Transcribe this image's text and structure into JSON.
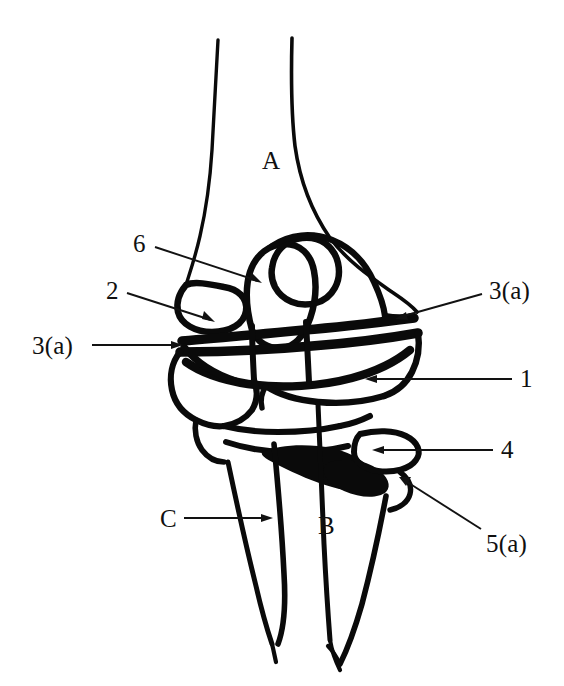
{
  "figure": {
    "kind": "anatomical-line-diagram",
    "background_color": "#ffffff",
    "ink_color": "#0a0a0a",
    "width": 564,
    "height": 686
  },
  "labels": [
    {
      "id": "label-a",
      "text": "A",
      "x": 262,
      "y": 148,
      "kind": "letter",
      "has_leader": false,
      "describes": "upper bone shaft (humerus)"
    },
    {
      "id": "label-6",
      "text": "6",
      "x": 133,
      "y": 231,
      "kind": "number",
      "has_leader": true,
      "leader": {
        "from_x": 155,
        "from_y": 247,
        "to_x": 262,
        "to_y": 283,
        "head": "arrow-down-right"
      },
      "describes": "upper inner loop structure of joint"
    },
    {
      "id": "label-2",
      "text": "2",
      "x": 106,
      "y": 278,
      "kind": "number",
      "has_leader": true,
      "leader": {
        "from_x": 127,
        "from_y": 293,
        "to_x": 215,
        "to_y": 322,
        "head": "arrow-down-right"
      },
      "describes": "left condylar prominence"
    },
    {
      "id": "label-3a-left",
      "text": "3(a)",
      "x": 32,
      "y": 333,
      "kind": "number-letter",
      "has_leader": true,
      "leader": {
        "from_x": 92,
        "from_y": 345,
        "to_x": 182,
        "to_y": 345,
        "head": "arrow-right"
      },
      "describes": "ligament band, left attachment"
    },
    {
      "id": "label-3a-right",
      "text": "3(a)",
      "x": 489,
      "y": 278,
      "kind": "number-letter",
      "has_leader": true,
      "leader": {
        "from_x": 482,
        "from_y": 294,
        "to_x": 396,
        "to_y": 319,
        "head": "arrow-down-left"
      },
      "describes": "ligament band, right attachment"
    },
    {
      "id": "label-1",
      "text": "1",
      "x": 520,
      "y": 366,
      "kind": "number",
      "has_leader": true,
      "leader": {
        "from_x": 512,
        "from_y": 379,
        "to_x": 366,
        "to_y": 379,
        "head": "arrow-left"
      },
      "describes": "main articular body of upper bone"
    },
    {
      "id": "label-4",
      "text": "4",
      "x": 501,
      "y": 437,
      "kind": "number",
      "has_leader": true,
      "leader": {
        "from_x": 493,
        "from_y": 450,
        "to_x": 372,
        "to_y": 450,
        "head": "arrow-left"
      },
      "describes": "radial head region"
    },
    {
      "id": "label-5a",
      "text": "5(a)",
      "x": 486,
      "y": 531,
      "kind": "number-letter",
      "has_leader": true,
      "leader": {
        "from_x": 481,
        "from_y": 529,
        "to_x": 400,
        "to_y": 477,
        "head": "arrow-up-left"
      },
      "describes": "annular ligament / lower joint capsule"
    },
    {
      "id": "label-c",
      "text": "C",
      "x": 160,
      "y": 506,
      "kind": "letter",
      "has_leader": true,
      "leader": {
        "from_x": 184,
        "from_y": 518,
        "to_x": 272,
        "to_y": 518,
        "head": "arrow-right"
      },
      "describes": "left lower bone shaft (ulna)"
    },
    {
      "id": "label-b",
      "text": "B",
      "x": 318,
      "y": 513,
      "kind": "letter",
      "has_leader": false,
      "describes": "right lower bone shaft (radius)"
    }
  ],
  "drawing": {
    "stroke_color": "#0a0a0a",
    "thin_stroke_width": 3.2,
    "thick_stroke_width": 9,
    "parts": [
      {
        "name": "humerus-shaft-left-edge",
        "type": "outline"
      },
      {
        "name": "humerus-shaft-right-edge",
        "type": "outline"
      },
      {
        "name": "lateral-condyle-loop",
        "type": "loop"
      },
      {
        "name": "capitellum-ring",
        "type": "loop"
      },
      {
        "name": "trochlea-loop",
        "type": "loop"
      },
      {
        "name": "ligament-band-upper",
        "type": "thick-band"
      },
      {
        "name": "ligament-band-lower",
        "type": "thick-band"
      },
      {
        "name": "articular-body",
        "type": "outline"
      },
      {
        "name": "radial-head",
        "type": "outline"
      },
      {
        "name": "annular-ligament",
        "type": "thick-fill"
      },
      {
        "name": "ulna-shaft",
        "type": "outline"
      },
      {
        "name": "radius-shaft",
        "type": "outline"
      }
    ]
  }
}
